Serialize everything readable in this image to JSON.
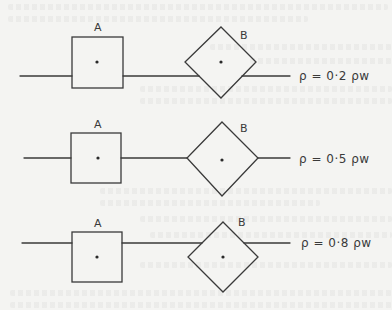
{
  "diagram": {
    "rows": [
      {
        "square_label": "A",
        "diamond_label": "B",
        "equation": "ρ = 0·2 ρw",
        "density_ratio": 0.2
      },
      {
        "square_label": "A",
        "diamond_label": "B",
        "equation": "ρ = 0·5 ρw",
        "density_ratio": 0.5
      },
      {
        "square_label": "A",
        "diamond_label": "B",
        "equation": "ρ = 0·8 ρw",
        "density_ratio": 0.8
      }
    ],
    "colors": {
      "line": "#3a3a3a",
      "background": "#f4f4f2"
    }
  }
}
